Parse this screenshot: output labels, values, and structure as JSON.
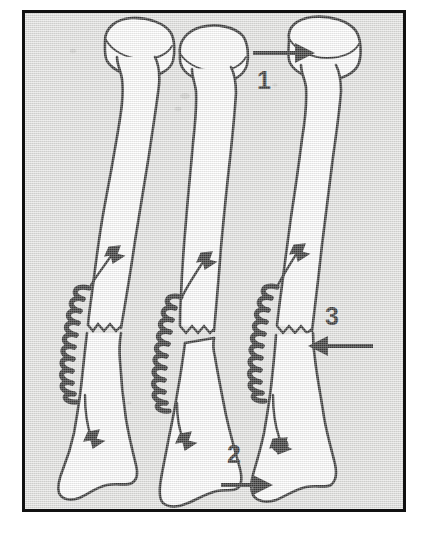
{
  "figure": {
    "kind": "anatomical-line-drawing",
    "background_color": "#e2e2e0",
    "border_color": "#111111",
    "ink_color": "#111111",
    "bone_fill_color": "#ffffff",
    "outer_color": "#ffffff"
  },
  "callouts": [
    {
      "id": "callout-1",
      "label": "1",
      "arrow_direction": "right",
      "points_at": "proximal bone head (radial head) of the right-hand bone",
      "label_x": 268,
      "label_y": 79,
      "arrow_x1": 256,
      "arrow_y1": 47,
      "arrow_x2": 312,
      "arrow_y2": 47
    },
    {
      "id": "callout-2",
      "label": "2",
      "arrow_direction": "right",
      "points_at": "distal end (styloid) of the right-hand bone",
      "label_x": 232,
      "label_y": 471,
      "arrow_x1": 219,
      "arrow_y1": 489,
      "arrow_x2": 268,
      "arrow_y2": 489
    },
    {
      "id": "callout-3",
      "label": "3",
      "arrow_direction": "left",
      "points_at": "transverse fracture line of the right-hand bone",
      "label_x": 325,
      "label_y": 331,
      "arrow_x1": 370,
      "arrow_y1": 346,
      "arrow_x2": 295,
      "arrow_y2": 346
    }
  ],
  "bones": [
    {
      "id": "bone-left",
      "position": "left",
      "state": "aligned / reduced fracture",
      "fracture": "transverse zigzag mid-shaft",
      "device": "helical spring tension band with two bone anchors"
    },
    {
      "id": "bone-middle",
      "position": "middle",
      "state": "angulated / displaced fracture",
      "fracture": "transverse zigzag mid-shaft with angulation",
      "device": "helical spring tension band with two bone anchors"
    },
    {
      "id": "bone-right",
      "position": "right",
      "state": "aligned / reduced fracture",
      "fracture": "transverse zigzag mid-shaft",
      "device": "helical spring tension band with two bone anchors"
    }
  ],
  "parts": {
    "coil_label": "tension spring",
    "anchor_label": "bone anchor",
    "wire_label": "tension wire",
    "fracture_label": "fracture line",
    "head_label": "bone head",
    "shaft_label": "bone shaft",
    "distal_label": "distal end"
  }
}
